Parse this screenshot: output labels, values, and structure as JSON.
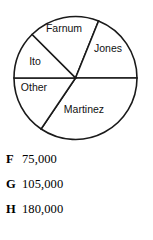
{
  "chart_data": {
    "type": "pie",
    "title": "",
    "categories": [
      "Farnum",
      "Jones",
      "Martinez",
      "Other",
      "Ito"
    ],
    "values": [
      15,
      19,
      28,
      10,
      13
    ],
    "labels": [
      "Farnum",
      "Jones",
      "Martinez",
      "Other",
      "Ito"
    ],
    "legend_position": "none",
    "grid": false,
    "slice_color": "#ffffff",
    "outline_color": "#1a1a1a",
    "slices": [
      {
        "name": "Farnum",
        "label": "Farnum",
        "start_angle_deg": 315,
        "end_angle_deg": 382,
        "label_x": 64,
        "label_y": 29
      },
      {
        "name": "Jones",
        "label": "Jones",
        "start_angle_deg": 22,
        "end_angle_deg": 90,
        "label_x": 108,
        "label_y": 49
      },
      {
        "name": "Martinez",
        "label": "Martinez",
        "start_angle_deg": 90,
        "end_angle_deg": 214,
        "label_x": 84,
        "label_y": 110
      },
      {
        "name": "Other",
        "label": "Other",
        "start_angle_deg": 214,
        "end_angle_deg": 270,
        "label_x": 34,
        "label_y": 88
      },
      {
        "name": "Ito",
        "label": "Ito",
        "start_angle_deg": 270,
        "end_angle_deg": 315,
        "label_x": 35,
        "label_y": 62
      }
    ],
    "geometry": {
      "center_x": 75.5,
      "center_y": 78,
      "radius": 61.5
    }
  },
  "answers": {
    "options": [
      {
        "letter": "F",
        "value": "75,000"
      },
      {
        "letter": "G",
        "value": "105,000"
      },
      {
        "letter": "H",
        "value": "180,000"
      }
    ]
  }
}
